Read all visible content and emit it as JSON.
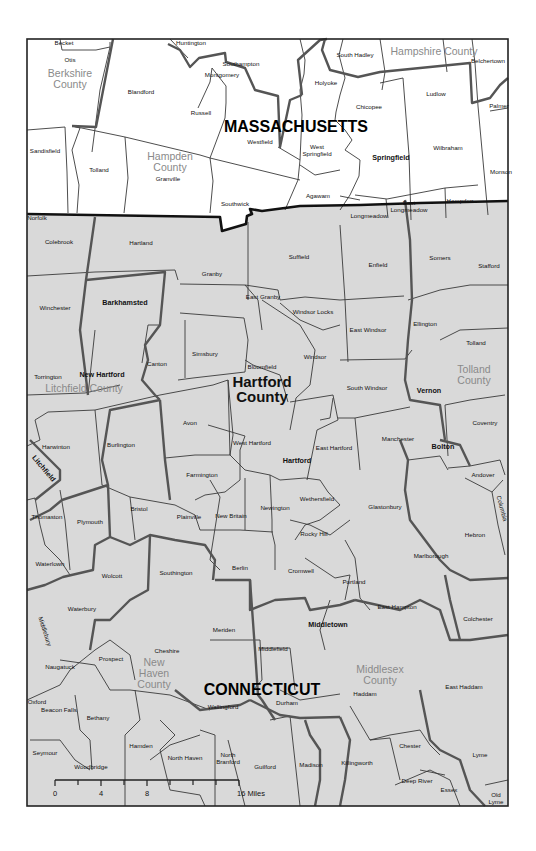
{
  "map": {
    "states": [
      {
        "name": "MASSACHUSETTS",
        "x": 296,
        "y": 132
      },
      {
        "name": "CONNECTICUT",
        "x": 262,
        "y": 695
      }
    ],
    "counties": [
      {
        "name": "Berkshire",
        "line2": "County",
        "x": 70,
        "y": 77,
        "emphasis": false
      },
      {
        "name": "Hampshire County",
        "line2": "",
        "x": 434,
        "y": 55,
        "emphasis": false
      },
      {
        "name": "Hampden",
        "line2": "County",
        "x": 170,
        "y": 160,
        "emphasis": false
      },
      {
        "name": "Litchfield County",
        "line2": "",
        "x": 84,
        "y": 392,
        "emphasis": false
      },
      {
        "name": "Hartford",
        "line2": "County",
        "x": 262,
        "y": 387,
        "emphasis": true
      },
      {
        "name": "Tolland",
        "line2": "County",
        "x": 474,
        "y": 373,
        "emphasis": false
      },
      {
        "name": "New",
        "line2": "Haven",
        "line3": "County",
        "x": 154,
        "y": 666,
        "emphasis": false
      },
      {
        "name": "Middlesex",
        "line2": "County",
        "x": 380,
        "y": 673,
        "emphasis": false
      }
    ],
    "towns": {
      "massachusetts": [
        {
          "name": "Becket",
          "x": 64,
          "y": 45
        },
        {
          "name": "Otis",
          "x": 70,
          "y": 62
        },
        {
          "name": "Huntington",
          "x": 191,
          "y": 45
        },
        {
          "name": "Southampton",
          "x": 241,
          "y": 66
        },
        {
          "name": "Montgomery",
          "x": 222,
          "y": 77
        },
        {
          "name": "Blandford",
          "x": 141,
          "y": 94
        },
        {
          "name": "Russell",
          "x": 201,
          "y": 115
        },
        {
          "name": "South Hadley",
          "x": 355,
          "y": 57
        },
        {
          "name": "Belchertown",
          "x": 488,
          "y": 63
        },
        {
          "name": "Holyoke",
          "x": 326,
          "y": 85
        },
        {
          "name": "Ludlow",
          "x": 436,
          "y": 96
        },
        {
          "name": "Palmer",
          "x": 499,
          "y": 108
        },
        {
          "name": "Chicopee",
          "x": 369,
          "y": 109
        },
        {
          "name": "Westfield",
          "x": 260,
          "y": 144
        },
        {
          "name": "West",
          "line2": "Springfield",
          "x": 317,
          "y": 149
        },
        {
          "name": "Springfield",
          "x": 391,
          "y": 160,
          "bold": true
        },
        {
          "name": "Wilbraham",
          "x": 448,
          "y": 150
        },
        {
          "name": "Monson",
          "x": 501,
          "y": 174
        },
        {
          "name": "Sandisfield",
          "x": 45,
          "y": 153
        },
        {
          "name": "Tolland",
          "x": 99,
          "y": 172
        },
        {
          "name": "Granville",
          "x": 168,
          "y": 181
        },
        {
          "name": "Southwick",
          "x": 235,
          "y": 206
        },
        {
          "name": "Agawam",
          "x": 318,
          "y": 198
        },
        {
          "name": "East",
          "line2": "Longmeadow",
          "x": 409,
          "y": 205
        },
        {
          "name": "Hampden",
          "x": 460,
          "y": 203
        },
        {
          "name": "Longmeadow",
          "x": 369,
          "y": 218
        }
      ],
      "connecticut": [
        {
          "name": "Norfolk",
          "x": 37,
          "y": 220
        },
        {
          "name": "Colebrook",
          "x": 59,
          "y": 244
        },
        {
          "name": "Hartland",
          "x": 141,
          "y": 245
        },
        {
          "name": "Suffield",
          "x": 299,
          "y": 259
        },
        {
          "name": "Enfield",
          "x": 378,
          "y": 267
        },
        {
          "name": "Somers",
          "x": 440,
          "y": 260
        },
        {
          "name": "Stafford",
          "x": 489,
          "y": 268
        },
        {
          "name": "Granby",
          "x": 212,
          "y": 276
        },
        {
          "name": "Winchester",
          "x": 55,
          "y": 310
        },
        {
          "name": "Barkhamsted",
          "x": 125,
          "y": 305,
          "bold": true
        },
        {
          "name": "East Granby",
          "x": 263,
          "y": 299
        },
        {
          "name": "Windsor Locks",
          "x": 313,
          "y": 314
        },
        {
          "name": "East Windsor",
          "x": 368,
          "y": 332
        },
        {
          "name": "Ellington",
          "x": 425,
          "y": 326
        },
        {
          "name": "Tolland",
          "x": 476,
          "y": 345
        },
        {
          "name": "Simsbury",
          "x": 205,
          "y": 356
        },
        {
          "name": "Canton",
          "x": 157,
          "y": 366
        },
        {
          "name": "Bloomfield",
          "x": 262,
          "y": 369
        },
        {
          "name": "Windsor",
          "x": 315,
          "y": 359
        },
        {
          "name": "Torrington",
          "x": 48,
          "y": 379
        },
        {
          "name": "New Hartford",
          "x": 102,
          "y": 377,
          "bold": true
        },
        {
          "name": "South Windsor",
          "x": 367,
          "y": 390
        },
        {
          "name": "Vernon",
          "x": 429,
          "y": 393,
          "bold": true
        },
        {
          "name": "Coventry",
          "x": 485,
          "y": 425
        },
        {
          "name": "Avon",
          "x": 190,
          "y": 425
        },
        {
          "name": "West Hartford",
          "x": 252,
          "y": 445
        },
        {
          "name": "Harwinton",
          "x": 56,
          "y": 449
        },
        {
          "name": "Burlington",
          "x": 121,
          "y": 447
        },
        {
          "name": "East Hartford",
          "x": 334,
          "y": 450
        },
        {
          "name": "Manchester",
          "x": 398,
          "y": 441
        },
        {
          "name": "Bolton",
          "x": 443,
          "y": 449,
          "bold": true
        },
        {
          "name": "Hartford",
          "x": 297,
          "y": 463,
          "bold": true
        },
        {
          "name": "Andover",
          "x": 483,
          "y": 477
        },
        {
          "name": "Farmington",
          "x": 202,
          "y": 477
        },
        {
          "name": "Thomaston",
          "x": 47,
          "y": 519
        },
        {
          "name": "Plymouth",
          "x": 90,
          "y": 524
        },
        {
          "name": "Bristol",
          "x": 139,
          "y": 511
        },
        {
          "name": "Plainville",
          "x": 189,
          "y": 519
        },
        {
          "name": "New Britain",
          "x": 231,
          "y": 518
        },
        {
          "name": "Newington",
          "x": 275,
          "y": 510
        },
        {
          "name": "Wethersfield",
          "x": 317,
          "y": 501
        },
        {
          "name": "Glastonbury",
          "x": 385,
          "y": 509
        },
        {
          "name": "Hebron",
          "x": 475,
          "y": 537
        },
        {
          "name": "Rocky Hill",
          "x": 314,
          "y": 536
        },
        {
          "name": "Waterlown",
          "x": 50,
          "y": 566
        },
        {
          "name": "Wolcott",
          "x": 112,
          "y": 578
        },
        {
          "name": "Southington",
          "x": 176,
          "y": 575
        },
        {
          "name": "Berlin",
          "x": 240,
          "y": 570
        },
        {
          "name": "Cromwell",
          "x": 301,
          "y": 573
        },
        {
          "name": "Marlborough",
          "x": 431,
          "y": 558
        },
        {
          "name": "Portland",
          "x": 354,
          "y": 584
        },
        {
          "name": "Waterbury",
          "x": 82,
          "y": 611
        },
        {
          "name": "East Hampton",
          "x": 397,
          "y": 609
        },
        {
          "name": "Colchester",
          "x": 478,
          "y": 621
        },
        {
          "name": "Meriden",
          "x": 224,
          "y": 632
        },
        {
          "name": "Middletown",
          "x": 328,
          "y": 627,
          "bold": true
        },
        {
          "name": "Cheshire",
          "x": 167,
          "y": 653
        },
        {
          "name": "Prospect",
          "x": 111,
          "y": 661
        },
        {
          "name": "Middlefield",
          "x": 273,
          "y": 651
        },
        {
          "name": "Naugatuck",
          "x": 60,
          "y": 669
        },
        {
          "name": "East Haddam",
          "x": 464,
          "y": 689
        },
        {
          "name": "Haddam",
          "x": 365,
          "y": 696
        },
        {
          "name": "Oxford",
          "x": 37,
          "y": 704
        },
        {
          "name": "Beacon Falls",
          "x": 59,
          "y": 712
        },
        {
          "name": "Wallingford",
          "x": 223,
          "y": 709
        },
        {
          "name": "Durham",
          "x": 287,
          "y": 705
        },
        {
          "name": "Bethany",
          "x": 98,
          "y": 720
        },
        {
          "name": "Seymour",
          "x": 45,
          "y": 755
        },
        {
          "name": "Hamden",
          "x": 141,
          "y": 748
        },
        {
          "name": "Woodbridge",
          "x": 91,
          "y": 769
        },
        {
          "name": "North Haven",
          "x": 185,
          "y": 760
        },
        {
          "name": "North",
          "line2": "Branford",
          "x": 228,
          "y": 757
        },
        {
          "name": "Guilford",
          "x": 265,
          "y": 769
        },
        {
          "name": "Madison",
          "x": 311,
          "y": 767
        },
        {
          "name": "Killingworth",
          "x": 357,
          "y": 765
        },
        {
          "name": "Chester",
          "x": 410,
          "y": 748
        },
        {
          "name": "Lyme",
          "x": 480,
          "y": 757
        },
        {
          "name": "Deep River",
          "x": 417,
          "y": 783
        },
        {
          "name": "Essex",
          "x": 449,
          "y": 792
        },
        {
          "name": "Old",
          "line2": "Lyme",
          "x": 496,
          "y": 797
        }
      ],
      "rotated": [
        {
          "name": "Litchfield",
          "x": 42,
          "y": 470,
          "angle": 50,
          "bold": true
        },
        {
          "name": "Middlebury",
          "x": 43,
          "y": 632,
          "angle": 72
        },
        {
          "name": "Columbia",
          "x": 500,
          "y": 509,
          "angle": 75
        }
      ]
    },
    "scale_bar": {
      "labels": [
        "0",
        "4",
        "8",
        "16 Miles"
      ],
      "unit": "Miles",
      "max": 16
    }
  }
}
